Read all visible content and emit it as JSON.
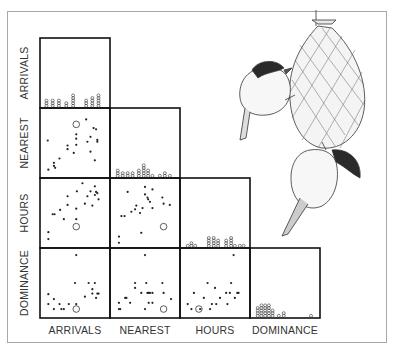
{
  "chart_data": {
    "type": "scatter",
    "subtype": "scatterplot-matrix-lower-triangle",
    "variables": [
      "ARRIVALS",
      "NEAREST",
      "HOURS",
      "DOMINANCE"
    ],
    "row_labels": [
      "ARRIVALS",
      "NEAREST",
      "HOURS",
      "DOMINANCE"
    ],
    "column_labels": [
      "ARRIVALS",
      "NEAREST",
      "HOURS",
      "DOMINANCE"
    ],
    "value_scale": "normalized 0-1 (no axis ticks shown)",
    "grid": false,
    "legend": "none",
    "diagonal": {
      "type": "dot-stack-histogram",
      "ARRIVALS": {
        "bins": [
          0.04,
          0.14,
          0.24,
          0.36,
          0.47,
          0.57,
          0.68,
          0.78,
          0.88
        ],
        "counts": [
          3,
          3,
          3,
          2,
          5,
          0,
          3,
          4,
          5
        ]
      },
      "NEAREST": {
        "bins": [
          0.06,
          0.14,
          0.22,
          0.3,
          0.4,
          0.48,
          0.55,
          0.62,
          0.74,
          0.82,
          0.9
        ],
        "counts": [
          3,
          2,
          2,
          2,
          3,
          5,
          3,
          1,
          1,
          2,
          1
        ]
      },
      "HOURS": {
        "bins": [
          0.06,
          0.12,
          0.18,
          0.4,
          0.48,
          0.55,
          0.68,
          0.76,
          0.82,
          0.9,
          0.96
        ],
        "counts": [
          1,
          2,
          1,
          4,
          4,
          3,
          3,
          4,
          1,
          1,
          1
        ]
      },
      "DOMINANCE": {
        "bins": [
          0.06,
          0.12,
          0.18,
          0.24,
          0.3,
          0.4,
          0.48,
          0.92
        ],
        "counts": [
          4,
          5,
          5,
          5,
          3,
          1,
          2,
          1
        ]
      }
    },
    "panels": [
      {
        "row": "NEAREST",
        "col": "ARRIVALS",
        "points": [
          [
            0.06,
            0.54
          ],
          [
            0.07,
            0.07
          ],
          [
            0.16,
            0.13
          ],
          [
            0.16,
            0.18
          ],
          [
            0.25,
            0.25
          ],
          [
            0.18,
            0.1
          ],
          [
            0.38,
            0.46
          ],
          [
            0.38,
            0.4
          ],
          [
            0.48,
            0.34
          ],
          [
            0.52,
            0.47
          ],
          [
            0.52,
            0.64
          ],
          [
            0.52,
            0.57
          ],
          [
            0.68,
            0.88
          ],
          [
            0.7,
            0.52
          ],
          [
            0.75,
            0.6
          ],
          [
            0.75,
            0.36
          ],
          [
            0.8,
            0.74
          ],
          [
            0.84,
            0.72
          ],
          [
            0.86,
            0.55
          ],
          [
            0.86,
            0.52
          ],
          [
            0.82,
            0.22
          ]
        ],
        "outlier": [
          0.52,
          0.8
        ]
      },
      {
        "row": "HOURS",
        "col": "ARRIVALS",
        "points": [
          [
            0.07,
            0.19
          ],
          [
            0.07,
            0.08
          ],
          [
            0.14,
            0.48
          ],
          [
            0.17,
            0.48
          ],
          [
            0.26,
            0.55
          ],
          [
            0.32,
            0.4
          ],
          [
            0.38,
            0.63
          ],
          [
            0.38,
            0.77
          ],
          [
            0.52,
            0.57
          ],
          [
            0.53,
            0.85
          ],
          [
            0.52,
            0.4
          ],
          [
            0.66,
            0.65
          ],
          [
            0.7,
            0.77
          ],
          [
            0.75,
            0.85
          ],
          [
            0.78,
            0.62
          ],
          [
            0.82,
            0.79
          ],
          [
            0.82,
            0.93
          ],
          [
            0.84,
            0.84
          ],
          [
            0.86,
            0.82
          ],
          [
            0.88,
            0.72
          ],
          [
            0.62,
            0.98
          ]
        ],
        "outlier": [
          0.52,
          0.28
        ]
      },
      {
        "row": "HOURS",
        "col": "NEAREST",
        "points": [
          [
            0.08,
            0.12
          ],
          [
            0.08,
            0.02
          ],
          [
            0.12,
            0.45
          ],
          [
            0.17,
            0.45
          ],
          [
            0.22,
            0.84
          ],
          [
            0.28,
            0.52
          ],
          [
            0.34,
            0.56
          ],
          [
            0.36,
            0.62
          ],
          [
            0.42,
            0.5
          ],
          [
            0.46,
            0.58
          ],
          [
            0.5,
            0.92
          ],
          [
            0.5,
            0.8
          ],
          [
            0.54,
            0.75
          ],
          [
            0.55,
            0.72
          ],
          [
            0.58,
            0.68
          ],
          [
            0.62,
            0.58
          ],
          [
            0.62,
            0.88
          ],
          [
            0.78,
            0.75
          ],
          [
            0.8,
            0.65
          ],
          [
            0.9,
            0.63
          ],
          [
            0.44,
            0.18
          ]
        ],
        "outlier": [
          0.8,
          0.28
        ]
      },
      {
        "row": "DOMINANCE",
        "col": "ARRIVALS",
        "points": [
          [
            0.07,
            0.32
          ],
          [
            0.07,
            0.16
          ],
          [
            0.16,
            0.08
          ],
          [
            0.16,
            0.24
          ],
          [
            0.25,
            0.16
          ],
          [
            0.28,
            0.08
          ],
          [
            0.32,
            0.08
          ],
          [
            0.4,
            0.16
          ],
          [
            0.52,
            0.16
          ],
          [
            0.52,
            0.95
          ],
          [
            0.5,
            0.5
          ],
          [
            0.66,
            0.28
          ],
          [
            0.72,
            0.5
          ],
          [
            0.78,
            0.4
          ],
          [
            0.78,
            0.33
          ],
          [
            0.82,
            0.5
          ],
          [
            0.84,
            0.26
          ],
          [
            0.86,
            0.33
          ],
          [
            0.88,
            0.33
          ]
        ],
        "outlier": [
          0.52,
          0.08
        ]
      },
      {
        "row": "DOMINANCE",
        "col": "NEAREST",
        "points": [
          [
            0.08,
            0.08
          ],
          [
            0.1,
            0.08
          ],
          [
            0.08,
            0.18
          ],
          [
            0.18,
            0.26
          ],
          [
            0.2,
            0.26
          ],
          [
            0.26,
            0.18
          ],
          [
            0.34,
            0.42
          ],
          [
            0.34,
            0.5
          ],
          [
            0.44,
            0.34
          ],
          [
            0.5,
            0.08
          ],
          [
            0.5,
            0.95
          ],
          [
            0.52,
            0.5
          ],
          [
            0.54,
            0.34
          ],
          [
            0.56,
            0.34
          ],
          [
            0.58,
            0.34
          ],
          [
            0.56,
            0.18
          ],
          [
            0.62,
            0.18
          ],
          [
            0.62,
            0.34
          ],
          [
            0.78,
            0.5
          ],
          [
            0.8,
            0.34
          ],
          [
            0.92,
            0.24
          ]
        ],
        "outlier": [
          0.8,
          0.08
        ]
      },
      {
        "row": "DOMINANCE",
        "col": "HOURS",
        "points": [
          [
            0.06,
            0.16
          ],
          [
            0.12,
            0.08
          ],
          [
            0.16,
            0.34
          ],
          [
            0.26,
            0.08
          ],
          [
            0.32,
            0.26
          ],
          [
            0.38,
            0.5
          ],
          [
            0.42,
            0.08
          ],
          [
            0.45,
            0.16
          ],
          [
            0.5,
            0.42
          ],
          [
            0.52,
            0.16
          ],
          [
            0.58,
            0.26
          ],
          [
            0.68,
            0.34
          ],
          [
            0.7,
            0.16
          ],
          [
            0.74,
            0.34
          ],
          [
            0.76,
            0.5
          ],
          [
            0.8,
            0.95
          ],
          [
            0.82,
            0.26
          ],
          [
            0.86,
            0.34
          ],
          [
            0.88,
            0.34
          ]
        ],
        "outlier": [
          0.24,
          0.08
        ]
      }
    ]
  },
  "illustration": {
    "subject": "two chickadees at a mesh suet feeder",
    "icon": "chickadee-feeder-illustration"
  }
}
